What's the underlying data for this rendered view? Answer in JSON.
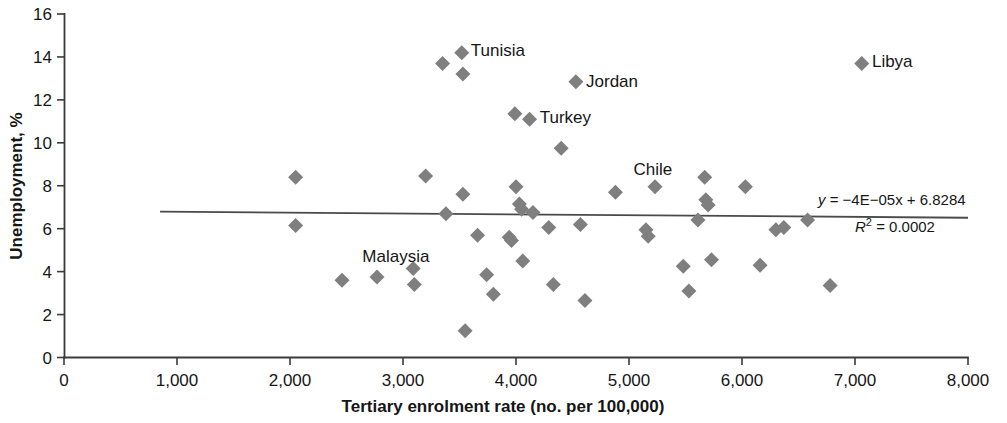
{
  "chart_data": {
    "type": "scatter",
    "title": "",
    "xlabel": "Tertiary enrolment rate (no. per 100,000)",
    "ylabel": "Unemployment, %",
    "xlim": [
      0,
      8000
    ],
    "ylim": [
      0,
      16
    ],
    "xticks": [
      "0",
      "1,000",
      "2,000",
      "3,000",
      "4,000",
      "5,000",
      "6,000",
      "7,000",
      "8,000"
    ],
    "xtick_values": [
      0,
      1000,
      2000,
      3000,
      4000,
      5000,
      6000,
      7000,
      8000
    ],
    "yticks": [
      "0",
      "2",
      "4",
      "6",
      "8",
      "10",
      "12",
      "14",
      "16"
    ],
    "ytick_values": [
      0,
      2,
      4,
      6,
      8,
      10,
      12,
      14,
      16
    ],
    "grid": false,
    "legend": false,
    "marker_color": "#7f7f7f",
    "marker_shape": "diamond",
    "points": [
      {
        "x": 2050,
        "y": 8.4,
        "label": ""
      },
      {
        "x": 2050,
        "y": 6.15,
        "label": ""
      },
      {
        "x": 2460,
        "y": 3.6,
        "label": ""
      },
      {
        "x": 2770,
        "y": 3.75,
        "label": ""
      },
      {
        "x": 3090,
        "y": 4.15,
        "label": ""
      },
      {
        "x": 3100,
        "y": 3.4,
        "label": ""
      },
      {
        "x": 3200,
        "y": 8.45,
        "label": ""
      },
      {
        "x": 3350,
        "y": 13.7,
        "label": ""
      },
      {
        "x": 3380,
        "y": 6.7,
        "label": ""
      },
      {
        "x": 3520,
        "y": 14.2,
        "label": "Tunisia"
      },
      {
        "x": 3530,
        "y": 13.2,
        "label": ""
      },
      {
        "x": 3530,
        "y": 7.6,
        "label": ""
      },
      {
        "x": 3550,
        "y": 1.25,
        "label": ""
      },
      {
        "x": 3660,
        "y": 5.7,
        "label": ""
      },
      {
        "x": 3740,
        "y": 3.85,
        "label": ""
      },
      {
        "x": 3800,
        "y": 2.95,
        "label": ""
      },
      {
        "x": 3940,
        "y": 5.6,
        "label": ""
      },
      {
        "x": 3960,
        "y": 5.45,
        "label": ""
      },
      {
        "x": 3990,
        "y": 11.35,
        "label": ""
      },
      {
        "x": 4000,
        "y": 7.95,
        "label": ""
      },
      {
        "x": 4030,
        "y": 7.15,
        "label": ""
      },
      {
        "x": 4050,
        "y": 6.9,
        "label": ""
      },
      {
        "x": 4060,
        "y": 4.5,
        "label": ""
      },
      {
        "x": 4120,
        "y": 11.1,
        "label": "Turkey"
      },
      {
        "x": 4150,
        "y": 6.75,
        "label": ""
      },
      {
        "x": 4290,
        "y": 6.05,
        "label": ""
      },
      {
        "x": 4330,
        "y": 3.4,
        "label": ""
      },
      {
        "x": 4400,
        "y": 9.75,
        "label": ""
      },
      {
        "x": 4530,
        "y": 12.85,
        "label": "Jordan"
      },
      {
        "x": 4570,
        "y": 6.2,
        "label": ""
      },
      {
        "x": 4610,
        "y": 2.65,
        "label": ""
      },
      {
        "x": 4880,
        "y": 7.7,
        "label": ""
      },
      {
        "x": 5150,
        "y": 5.95,
        "label": ""
      },
      {
        "x": 5170,
        "y": 5.65,
        "label": ""
      },
      {
        "x": 5230,
        "y": 7.95,
        "label": "Chile"
      },
      {
        "x": 5480,
        "y": 4.25,
        "label": ""
      },
      {
        "x": 5530,
        "y": 3.1,
        "label": ""
      },
      {
        "x": 5610,
        "y": 6.4,
        "label": ""
      },
      {
        "x": 5670,
        "y": 8.4,
        "label": ""
      },
      {
        "x": 5680,
        "y": 7.35,
        "label": ""
      },
      {
        "x": 5700,
        "y": 7.1,
        "label": ""
      },
      {
        "x": 5730,
        "y": 4.55,
        "label": ""
      },
      {
        "x": 6030,
        "y": 7.95,
        "label": ""
      },
      {
        "x": 6160,
        "y": 4.3,
        "label": ""
      },
      {
        "x": 6300,
        "y": 5.95,
        "label": ""
      },
      {
        "x": 6370,
        "y": 6.05,
        "label": ""
      },
      {
        "x": 6580,
        "y": 6.4,
        "label": ""
      },
      {
        "x": 6780,
        "y": 3.35,
        "label": ""
      },
      {
        "x": 7060,
        "y": 13.7,
        "label": "Libya"
      }
    ],
    "annotations": [
      {
        "name": "tunisia-label",
        "text": "Tunisia",
        "x": 3600,
        "y": 14.3
      },
      {
        "name": "jordan-label",
        "text": "Jordan",
        "x": 4620,
        "y": 12.9
      },
      {
        "name": "turkey-label",
        "text": "Turkey",
        "x": 4210,
        "y": 11.2
      },
      {
        "name": "chile-label",
        "text": "Chile",
        "x": 5040,
        "y": 8.8
      },
      {
        "name": "libya-label",
        "text": "Libya",
        "x": 7150,
        "y": 13.8
      },
      {
        "name": "malaysia-label",
        "text": "Malaysia",
        "x": 2640,
        "y": 4.75
      }
    ],
    "trendline": {
      "equation": "y = −4E−05x + 6.8284",
      "equation_y": "y",
      "equation_body": " = −4E−05x + 6.8284",
      "r_squared_label": "R",
      "r_squared_sup": "2",
      "r_squared_value": " = 0.0002",
      "r_squared_full": "R² = 0.0002",
      "slope": -4e-05,
      "intercept": 6.8284,
      "r2": 0.0002,
      "x_start": 850,
      "x_end": 8000
    }
  }
}
